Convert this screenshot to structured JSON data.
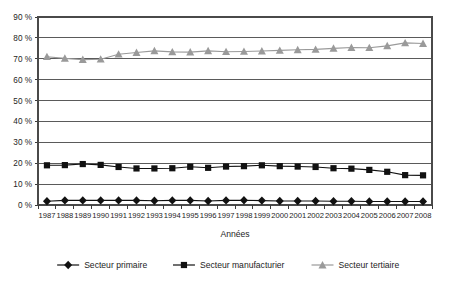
{
  "chart_data": {
    "type": "line",
    "title": "",
    "xlabel": "Années",
    "ylabel": "",
    "categories": [
      "1987",
      "1988",
      "1989",
      "1990",
      "1991",
      "1992",
      "1993",
      "1994",
      "1995",
      "1996",
      "1997",
      "1998",
      "1999",
      "2000",
      "2001",
      "2002",
      "2003",
      "2004",
      "2005",
      "2006",
      "2007",
      "2008"
    ],
    "ylim": [
      0,
      90
    ],
    "ytick_values": [
      0,
      10,
      20,
      30,
      40,
      50,
      60,
      70,
      80,
      90
    ],
    "ytick_labels": [
      "0 %",
      "10 %",
      "20 %",
      "30 %",
      "40 %",
      "50 %",
      "60 %",
      "70 %",
      "80 %",
      "90 %"
    ],
    "grid": true,
    "legend_position": "bottom",
    "series": [
      {
        "name": "Secteur primaire",
        "marker": "diamond",
        "color": "#111111",
        "values": [
          1.8,
          2.2,
          2.2,
          2.2,
          2.2,
          2.2,
          2.0,
          2.2,
          2.2,
          1.9,
          2.2,
          2.3,
          2.1,
          1.9,
          1.9,
          1.9,
          1.8,
          1.8,
          1.7,
          1.7,
          1.7,
          1.7
        ]
      },
      {
        "name": "Secteur manufacturier",
        "marker": "square",
        "color": "#111111",
        "values": [
          19.0,
          19.1,
          19.6,
          19.2,
          18.2,
          17.5,
          17.5,
          17.6,
          18.3,
          17.8,
          18.4,
          18.6,
          19.0,
          18.6,
          18.4,
          18.2,
          17.6,
          17.4,
          16.8,
          15.9,
          14.3,
          14.2
        ]
      },
      {
        "name": "Secteur tertiaire",
        "marker": "triangle",
        "color": "#9a9a9a",
        "values": [
          71.0,
          70.2,
          69.6,
          69.8,
          72.2,
          73.0,
          73.8,
          73.3,
          73.2,
          73.8,
          73.4,
          73.5,
          73.7,
          74.0,
          74.3,
          74.5,
          75.0,
          75.4,
          75.3,
          76.2,
          77.6,
          77.3
        ]
      }
    ]
  }
}
